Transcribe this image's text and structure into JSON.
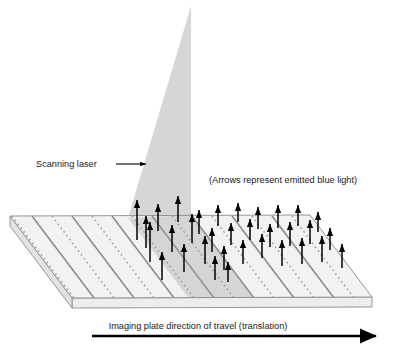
{
  "diagram": {
    "labels": {
      "scanning_laser": "Scanning laser",
      "arrows_note": "(Arrows represent emitted blue light)",
      "translation": "Imaging plate direction of travel (translation)"
    },
    "icons": {
      "laser_pointer_arrow": "arrow-right-icon",
      "translation_arrow": "arrow-right-icon",
      "emission_arrow": "arrow-up-icon"
    },
    "colors": {
      "background": "#ffffff",
      "laser_beam": "#d6d6d6",
      "laser_beam_on_plate": "#c9c9c9",
      "plate_top": "#f2f2f2",
      "plate_front": "#ededed",
      "plate_edge_line": "#8c8c8c",
      "stripe_solid": "#8a8a8a",
      "stripe_dotted": "#9a9a9a",
      "arrow_black": "#000000",
      "text": "#1a1a1a"
    },
    "geometry": {
      "plate_corners": {
        "back_left": [
          10,
          216
        ],
        "back_right": [
          310,
          215
        ],
        "front_right": [
          372,
          297
        ],
        "front_left": [
          72,
          298
        ]
      },
      "plate_thickness_px": 10,
      "laser_apex": [
        191,
        6
      ],
      "laser_base_left": [
        128,
        218
      ],
      "laser_base_right": [
        191,
        215
      ]
    },
    "emission_arrows_count": 33
  }
}
